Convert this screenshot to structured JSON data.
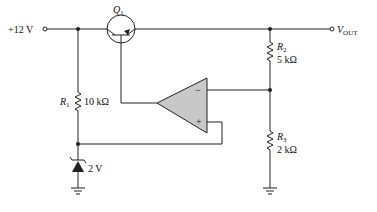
{
  "diagram": {
    "supply": {
      "label": "+12 V"
    },
    "output": {
      "label_main": "V",
      "label_sub": "OUT"
    },
    "transistor": {
      "label_main": "Q",
      "label_sub": "1"
    },
    "r1": {
      "name_main": "R",
      "name_sub": "1",
      "value": "10 kΩ"
    },
    "r2": {
      "name_main": "R",
      "name_sub": "2",
      "value": "5 kΩ"
    },
    "r3": {
      "name_main": "R",
      "name_sub": "3",
      "value": "2 kΩ"
    },
    "zener": {
      "value": "2 V"
    },
    "opamp": {
      "minus": "−",
      "plus": "+"
    },
    "colors": {
      "wire": "#222222",
      "opamp_fill": "#c8c8c8"
    }
  }
}
